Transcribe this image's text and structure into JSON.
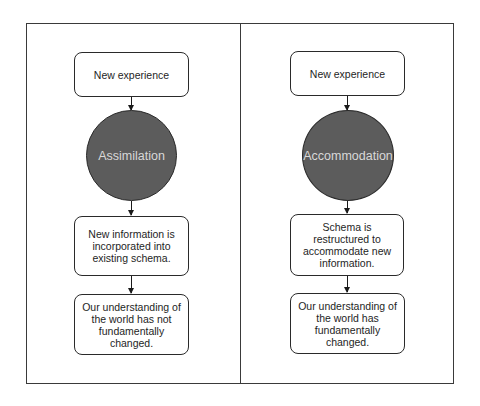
{
  "diagram": {
    "colors": {
      "border": "#3a3a3a",
      "circle_fill": "#5c5c5c",
      "circle_text": "#d8d8d8",
      "box_fill": "#ffffff",
      "text": "#1e1e1e"
    },
    "left": {
      "top_box": "New experience",
      "process": "Assimilation",
      "middle_box": "New information is\nincorporated into\nexisting schema.",
      "bottom_box": "Our understanding of\nthe world has not\nfundamentally\nchanged."
    },
    "right": {
      "top_box": "New experience",
      "process": "Accommodation",
      "middle_box": "Schema is\nrestructured to\naccommodate new\ninformation.",
      "bottom_box": "Our understanding of\nthe world has\nfundamentally\nchanged."
    }
  }
}
